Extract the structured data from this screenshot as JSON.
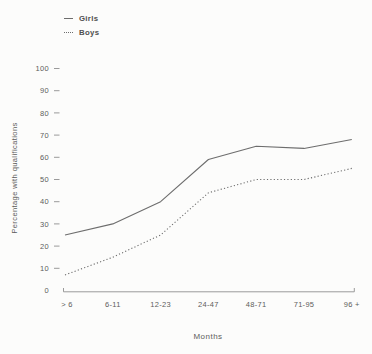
{
  "chart_data": {
    "type": "line",
    "title": "",
    "categories": [
      "> 6",
      "6-11",
      "12-23",
      "24-47",
      "48-71",
      "71-95",
      "96 +"
    ],
    "series": [
      {
        "name": "Girls",
        "line_style": "solid",
        "values": [
          25,
          30,
          40,
          59,
          65,
          64,
          68
        ]
      },
      {
        "name": "Boys",
        "line_style": "dotted",
        "values": [
          7,
          15,
          25,
          44,
          50,
          50,
          55
        ]
      }
    ],
    "xlabel": "Months",
    "ylabel": "Percentage with qualifications",
    "ylim": [
      0,
      100
    ],
    "yticks": [
      0,
      10,
      20,
      30,
      40,
      50,
      60,
      70,
      80,
      90,
      100
    ],
    "grid": false,
    "legend_position": "top-left",
    "line_color": "#6d6d6d",
    "axis_color": "#9a9a9a",
    "text_color": "#5c5c5c"
  }
}
